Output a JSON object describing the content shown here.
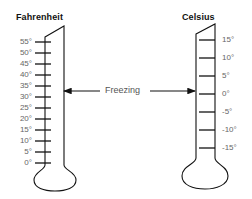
{
  "fahrenheit": {
    "title": "Fahrenheit",
    "ticks": [
      {
        "label": "55°",
        "y": 42
      },
      {
        "label": "50°",
        "y": 53
      },
      {
        "label": "45°",
        "y": 64
      },
      {
        "label": "40°",
        "y": 75
      },
      {
        "label": "35°",
        "y": 86
      },
      {
        "label": "30°",
        "y": 97
      },
      {
        "label": "25°",
        "y": 108
      },
      {
        "label": "20°",
        "y": 119
      },
      {
        "label": "15°",
        "y": 130
      },
      {
        "label": "10°",
        "y": 141
      },
      {
        "label": "5°",
        "y": 152
      },
      {
        "label": "0°",
        "y": 163
      }
    ]
  },
  "celsius": {
    "title": "Celsius",
    "ticks": [
      {
        "label": "15°",
        "y": 40
      },
      {
        "label": "10°",
        "y": 58
      },
      {
        "label": "5°",
        "y": 76
      },
      {
        "label": "0°",
        "y": 94
      },
      {
        "label": "-5°",
        "y": 112
      },
      {
        "label": "-10°",
        "y": 130
      },
      {
        "label": "-15°",
        "y": 148
      }
    ]
  },
  "freezing": {
    "label": "Freezing"
  },
  "colors": {
    "line": "#111111",
    "label_text": "#666666",
    "title_text": "#111111",
    "background": "#ffffff"
  }
}
